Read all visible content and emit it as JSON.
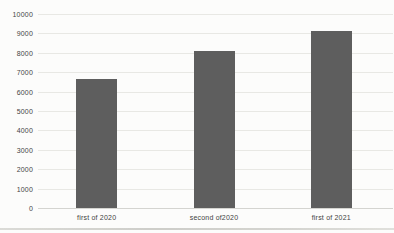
{
  "chart_data": {
    "type": "bar",
    "categories": [
      "first of 2020",
      "second of2020",
      "first of 2021"
    ],
    "values": [
      6700,
      8100,
      9150
    ],
    "title": "",
    "xlabel": "",
    "ylabel": "",
    "ylim": [
      0,
      10000
    ],
    "ytick_step": 1000,
    "ytick_labels": [
      "0",
      "1000",
      "2000",
      "3000",
      "4000",
      "5000",
      "6000",
      "7000",
      "8000",
      "9000",
      "10000"
    ],
    "grid": true,
    "legend": false,
    "colors": {
      "bar_fill": "#5e5e5e",
      "gridline": "#e5e5e1",
      "zero_axis_line": "#cfcfcb",
      "tick_text": "#454545",
      "category_text": "#3f3f3f",
      "page_background": "#fcfcfb",
      "page_rule_line": "#c9c9c4"
    }
  }
}
